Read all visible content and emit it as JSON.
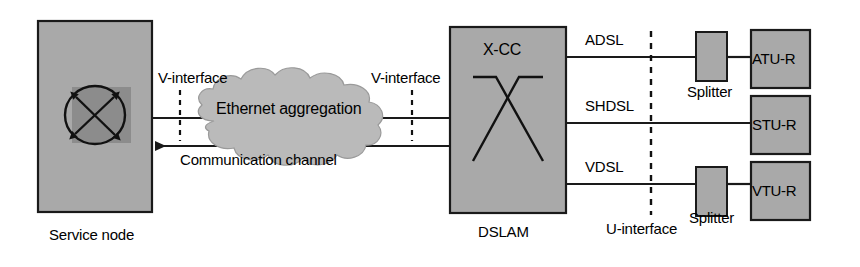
{
  "diagram": {
    "colors": {
      "box_fill": "#a8a8a8",
      "box_fill_light": "#b0b0b0",
      "inner_square_fill": "#8d8d8d",
      "cloud_fill": "#b9b9b9",
      "stroke": "#1a1a1a",
      "background": "#ffffff"
    },
    "nodes": {
      "service_node": {
        "label": "Service node",
        "symbol_name": "cross-connect-symbol"
      },
      "cloud": {
        "label": "Ethernet aggregation"
      },
      "dslam": {
        "label": "DSLAM",
        "inner_label": "X-CC",
        "symbol_name": "x-cross-connect-symbol"
      },
      "splitter_top": {
        "label": "Splitter"
      },
      "splitter_bottom": {
        "label": "Splitter"
      },
      "cpe": [
        {
          "label": "ATU-R"
        },
        {
          "label": "STU-R"
        },
        {
          "label": "VTU-R"
        }
      ]
    },
    "links": {
      "communication_channel": "Communication channel",
      "v_interface_left": "V-interface",
      "v_interface_right": "V-interface",
      "u_interface": "U-interface",
      "dsl_lines": [
        {
          "label": "ADSL"
        },
        {
          "label": "SHDSL"
        },
        {
          "label": "VDSL"
        }
      ]
    }
  }
}
